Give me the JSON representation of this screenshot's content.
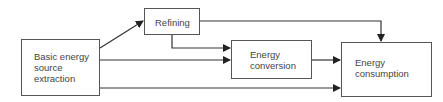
{
  "diagram": {
    "type": "flowchart",
    "nodes": [
      {
        "id": "basic",
        "lines": [
          "Basic energy",
          "source",
          "extraction"
        ]
      },
      {
        "id": "refining",
        "lines": [
          "Refining"
        ]
      },
      {
        "id": "conversion",
        "lines": [
          "Energy",
          "conversion"
        ]
      },
      {
        "id": "consumption",
        "lines": [
          "Energy",
          "consumption"
        ]
      }
    ],
    "edges": [
      {
        "from": "basic",
        "to": "refining"
      },
      {
        "from": "basic",
        "to": "conversion"
      },
      {
        "from": "basic",
        "to": "consumption"
      },
      {
        "from": "refining",
        "to": "conversion"
      },
      {
        "from": "refining",
        "to": "consumption"
      },
      {
        "from": "conversion",
        "to": "consumption"
      }
    ],
    "colors": {
      "line": "#333333",
      "text": "#444444"
    }
  }
}
